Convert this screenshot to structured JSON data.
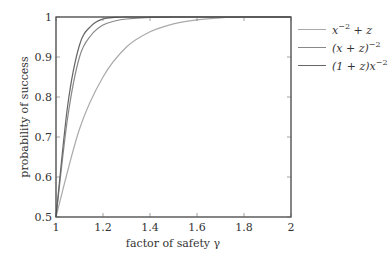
{
  "chart_data": {
    "type": "line",
    "title": "",
    "xlabel": "factor of safety γ",
    "ylabel": "probability of success",
    "xlim": [
      1,
      2
    ],
    "ylim": [
      0.5,
      1
    ],
    "xticks": [
      "1",
      "1.2",
      "1.4",
      "1.6",
      "1.8",
      "2"
    ],
    "yticks": [
      "0.5",
      "0.6",
      "0.7",
      "0.8",
      "0.9",
      "1"
    ],
    "grid": false,
    "legend_position": "outside-right-top",
    "series": [
      {
        "name": "x^-2 + z",
        "color": "#aaaaaa",
        "x": [
          1.0,
          1.1,
          1.2,
          1.3,
          1.4,
          1.5,
          1.6,
          1.7,
          1.8,
          1.9,
          2.0
        ],
        "y": [
          0.5,
          0.72,
          0.85,
          0.925,
          0.963,
          0.983,
          0.993,
          0.998,
          1.0,
          1.0,
          1.0
        ]
      },
      {
        "name": "(x + z)^-2",
        "color": "#888888",
        "x": [
          1.0,
          1.05,
          1.1,
          1.15,
          1.2,
          1.25,
          1.3,
          1.4,
          1.5,
          1.6,
          2.0
        ],
        "y": [
          0.5,
          0.75,
          0.9,
          0.955,
          0.98,
          0.99,
          0.995,
          0.999,
          1.0,
          1.0,
          1.0
        ]
      },
      {
        "name": "(1 + z)x^-2",
        "color": "#666666",
        "x": [
          1.0,
          1.05,
          1.1,
          1.15,
          1.2,
          1.25,
          1.3,
          1.4,
          2.0
        ],
        "y": [
          0.5,
          0.78,
          0.93,
          0.978,
          0.995,
          0.999,
          1.0,
          1.0,
          1.0
        ]
      }
    ]
  },
  "legend": {
    "items": [
      {
        "base": "x",
        "sup": "−2",
        "rest": " + z",
        "color": "#aaaaaa"
      },
      {
        "base": "(x + z)",
        "sup": "−2",
        "rest": "",
        "color": "#888888"
      },
      {
        "base": "(1 + z)x",
        "sup": "−2",
        "rest": "",
        "color": "#666666"
      }
    ]
  }
}
